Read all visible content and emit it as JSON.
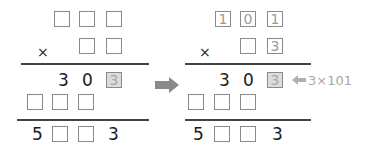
{
  "diagram": {
    "type": "multiplication-puzzle-step",
    "left": {
      "multiplicand": [
        "",
        "",
        ""
      ],
      "multiplier": [
        "",
        ""
      ],
      "operator": "×",
      "partial1": [
        "3",
        "0",
        "3"
      ],
      "partial2": [
        "",
        "",
        ""
      ],
      "result": [
        "5",
        "",
        "",
        "3"
      ]
    },
    "right": {
      "multiplicand": [
        "1",
        "0",
        "1"
      ],
      "multiplier": [
        "",
        "3"
      ],
      "operator": "×",
      "partial1": [
        "3",
        "0",
        "3"
      ],
      "partial2": [
        "",
        "",
        ""
      ],
      "result": [
        "5",
        "",
        "",
        "3"
      ],
      "annotation": "3×101"
    },
    "colors": {
      "box_border": "#8a8a8a",
      "shaded_fill": "#dcdcdc",
      "hint_text": "#9a9a9a",
      "arrow": "#8a8a8a",
      "ink": "#1a1a1a"
    }
  }
}
